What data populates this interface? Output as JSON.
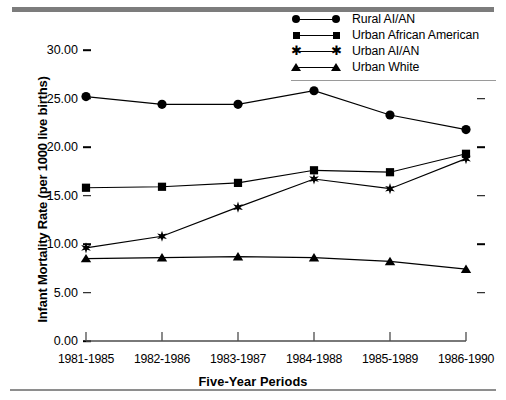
{
  "chart_data": {
    "type": "line",
    "title": "",
    "xlabel": "Five-Year Periods",
    "ylabel": "Infant Mortality Rate (per 1000 live births)",
    "categories": [
      "1981-1985",
      "1982-1986",
      "1983-1987",
      "1984-1988",
      "1985-1989",
      "1986-1990"
    ],
    "ylim": [
      0.0,
      32.0
    ],
    "yticks": [
      "0.00",
      "5.00",
      "10.00",
      "15.00",
      "20.00",
      "25.00",
      "30.00"
    ],
    "ytick_values": [
      0,
      5,
      10,
      15,
      20,
      25,
      30
    ],
    "grid": false,
    "legend_position": "top-right",
    "series": [
      {
        "name": "Rural AI/AN",
        "marker": "circle",
        "values": [
          25.2,
          24.4,
          24.4,
          25.8,
          23.3,
          21.8
        ]
      },
      {
        "name": "Urban African American",
        "marker": "square",
        "values": [
          15.8,
          15.9,
          16.3,
          17.6,
          17.4,
          19.3
        ]
      },
      {
        "name": "Urban AI/AN",
        "marker": "star",
        "values": [
          9.6,
          10.8,
          13.8,
          16.7,
          15.7,
          18.8
        ]
      },
      {
        "name": "Urban White",
        "marker": "triangle",
        "values": [
          8.5,
          8.6,
          8.7,
          8.6,
          8.2,
          7.4
        ]
      }
    ]
  },
  "legend": {
    "items": [
      {
        "label": "Rural AI/AN",
        "marker": "circle"
      },
      {
        "label": "Urban African American",
        "marker": "square"
      },
      {
        "label": "Urban AI/AN",
        "marker": "star"
      },
      {
        "label": "Urban White",
        "marker": "triangle"
      }
    ]
  },
  "colors": {
    "line": "#000000",
    "marker": "#000000",
    "rule_top": "#7c7c7c",
    "rule_bottom": "#8e8e8e",
    "legend_rule": "#9a9a9a",
    "background": "#ffffff"
  }
}
